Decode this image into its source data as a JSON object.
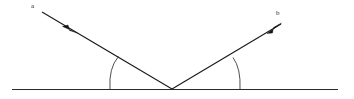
{
  "figure": {
    "kind": "reflection-ray-diagram",
    "background_color": "#ffffff",
    "line_color": "#1b1b1b",
    "surface_color": "#2a2a2a",
    "arc_color": "#3a3a3a",
    "width": 354,
    "height": 99
  },
  "labels": {
    "incident_ray": "a",
    "reflected_ray": "b"
  },
  "geometry": {
    "vertex": {
      "x": 172,
      "y": 89
    },
    "surface": {
      "x1": 12,
      "y1": 89.5,
      "x2": 338,
      "y2": 89.5
    },
    "incident_ray": {
      "x1": 42,
      "y1": 12,
      "x2": 172,
      "y2": 89
    },
    "reflected_ray": {
      "x1": 172,
      "y1": 89,
      "x2": 281,
      "y2": 24
    },
    "incident_arrow": {
      "x": 70,
      "y": 28.5,
      "direction": "down-right"
    },
    "reflected_arrow": {
      "x": 278,
      "y": 26,
      "direction": "up-right"
    },
    "left_arc": {
      "start_x": 110,
      "start_y": 89,
      "end_x": 118.5,
      "end_y": 56.5,
      "radius": 34
    },
    "right_arc": {
      "start_x": 240,
      "start_y": 89,
      "end_x": 233,
      "end_y": 57.5,
      "radius": 34
    }
  }
}
